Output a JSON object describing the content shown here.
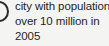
{
  "legend": {
    "marker": {
      "icon": "circle-outline-marker",
      "shape": "circle",
      "fill": "none",
      "stroke_color": "#2b2b2b",
      "clipped": true
    },
    "label_lines": [
      "city with population",
      "over 10 million in",
      "2005"
    ],
    "full_label": "city with population over 10 million in 2005",
    "text_color": "#262626",
    "background_color": "#f4f4f2"
  }
}
